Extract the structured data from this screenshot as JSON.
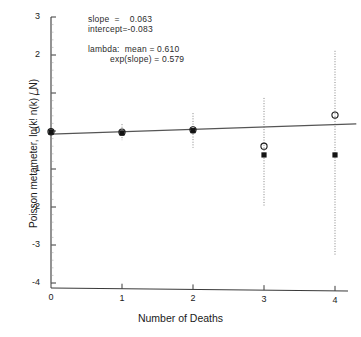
{
  "chart_data": {
    "type": "scatter",
    "title": "",
    "xlabel": "Number of Deaths",
    "ylabel": "Poisson metameter, ln(k! n(k) / N)",
    "xlim": [
      -0.15,
      4.35
    ],
    "ylim": [
      -4,
      3
    ],
    "xticks": [
      0,
      1,
      2,
      3,
      4
    ],
    "xtick_labels": [
      "0",
      "1",
      "2",
      "3",
      "4"
    ],
    "yticks": [
      -4,
      -3,
      -2,
      -1,
      0,
      1,
      2,
      3
    ],
    "ytick_labels": [
      "-4",
      "-3",
      "-2",
      "-1",
      "0",
      "1",
      "2",
      "3"
    ],
    "grid": false,
    "legend": "none",
    "x": [
      0,
      1,
      2,
      3,
      4
    ],
    "series": [
      {
        "name": "observed-open-circle",
        "marker": "open-circle",
        "values": [
          -0.02,
          -0.03,
          0.03,
          -0.4,
          0.42
        ]
      },
      {
        "name": "fitted-filled-square",
        "marker": "filled-square",
        "values": [
          -0.03,
          -0.05,
          0.01,
          -0.63,
          -0.63
        ]
      }
    ],
    "error_bars": [
      {
        "x": 0,
        "low": -0.1,
        "high": 0.06
      },
      {
        "x": 1,
        "low": -0.24,
        "high": 0.18
      },
      {
        "x": 2,
        "low": -0.44,
        "high": 0.47
      },
      {
        "x": 3,
        "low": -2.0,
        "high": 0.87
      },
      {
        "x": 4,
        "low": -3.29,
        "high": 2.11
      }
    ],
    "fit_line": {
      "name": "regression-line",
      "slope": 0.063,
      "intercept": -0.083,
      "x_start": 0,
      "x_end": 4.3,
      "y_start": -0.083,
      "y_end": 0.188
    }
  },
  "annotations": {
    "slope": "slope  =    0.063",
    "intercept": "intercept=-0.083",
    "lambda_mean": "lambda:  mean = 0.610",
    "exp_slope": "exp(slope) = 0.579"
  },
  "axes": {
    "x_label": "Number of Deaths",
    "y_label": "Poisson metameter, ln(k! n(k) / N)"
  }
}
